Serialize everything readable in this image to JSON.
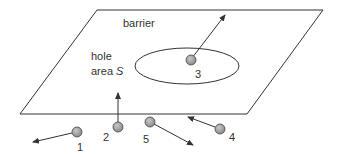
{
  "diagram": {
    "labels": {
      "barrier": "barrier",
      "hole_line1": "hole",
      "hole_line2": "area ",
      "hole_symbol": "S"
    },
    "particles": [
      {
        "id": "1",
        "label": "1"
      },
      {
        "id": "2",
        "label": "2"
      },
      {
        "id": "3",
        "label": "3"
      },
      {
        "id": "4",
        "label": "4"
      },
      {
        "id": "5",
        "label": "5"
      }
    ],
    "colors": {
      "line": "#333333",
      "particle_fill": "#9a9a9a",
      "particle_stroke": "#444444"
    }
  }
}
